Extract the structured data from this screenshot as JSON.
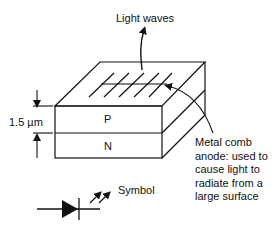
{
  "diagram": {
    "labels": {
      "light_waves": "Light waves",
      "thickness": "1.5 µm",
      "p_layer": "P",
      "n_layer": "N",
      "anode_note": "Metal comb anode: used to cause light to radiate from a large surface",
      "symbol": "Symbol"
    },
    "components": [
      {
        "name": "P-type layer",
        "label": "P"
      },
      {
        "name": "N-type layer",
        "label": "N"
      },
      {
        "name": "Metal comb anode",
        "tines": 6
      },
      {
        "name": "LED schematic symbol",
        "arrows": 2
      }
    ],
    "colors": {
      "line": "#111111",
      "background": "#ffffff"
    }
  }
}
